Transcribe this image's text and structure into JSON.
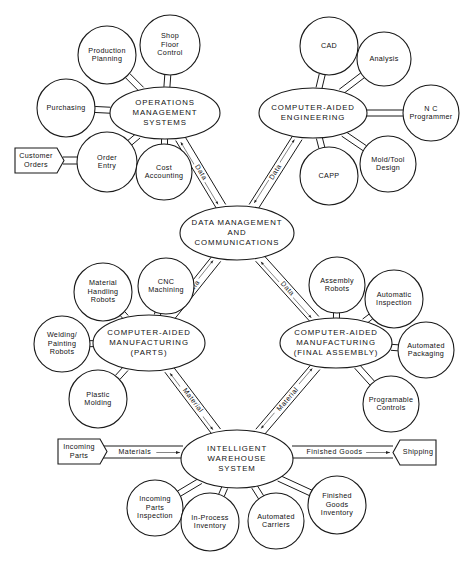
{
  "hubs": [
    {
      "id": "oms",
      "lines": [
        "OPERATIONS",
        "MANAGEMENT",
        "SYSTEMS"
      ],
      "cx": 165,
      "cy": 113,
      "rx": 55,
      "ry": 26
    },
    {
      "id": "cae",
      "lines": [
        "COMPUTER-AIDED",
        "ENGINEERING"
      ],
      "cx": 313,
      "cy": 113,
      "rx": 54,
      "ry": 25
    },
    {
      "id": "dmc",
      "lines": [
        "DATA MANAGEMENT",
        "AND",
        "COMMUNICATIONS"
      ],
      "cx": 237,
      "cy": 233,
      "rx": 57,
      "ry": 27
    },
    {
      "id": "camp",
      "lines": [
        "COMPUTER-AIDED",
        "MANUFACTURING",
        "(PARTS)"
      ],
      "cx": 149,
      "cy": 343,
      "rx": 56,
      "ry": 28
    },
    {
      "id": "camf",
      "lines": [
        "COMPUTER-AIDED",
        "MANUFACTURING",
        "(FINAL ASSEMBLY)"
      ],
      "cx": 336,
      "cy": 343,
      "rx": 56,
      "ry": 25
    },
    {
      "id": "iws",
      "lines": [
        "INTELLIGENT",
        "WAREHOUSE",
        "SYSTEM"
      ],
      "cx": 237,
      "cy": 459,
      "rx": 56,
      "ry": 29
    }
  ],
  "satellites": [
    {
      "id": "production-planning",
      "hub": "oms",
      "lines": [
        "Production",
        "Planning"
      ],
      "cx": 107,
      "cy": 55,
      "r": 29
    },
    {
      "id": "shop-floor-control",
      "hub": "oms",
      "lines": [
        "Shop",
        "Floor",
        "Control"
      ],
      "cx": 170,
      "cy": 45,
      "r": 30
    },
    {
      "id": "purchasing",
      "hub": "oms",
      "lines": [
        "Purchasing"
      ],
      "cx": 66,
      "cy": 108,
      "r": 29
    },
    {
      "id": "order-entry",
      "hub": "oms",
      "lines": [
        "Order",
        "Entry"
      ],
      "cx": 107,
      "cy": 162,
      "r": 30
    },
    {
      "id": "cost-accounting",
      "hub": "oms",
      "lines": [
        "Cost",
        "Accounting"
      ],
      "cx": 164,
      "cy": 172,
      "r": 28
    },
    {
      "id": "cad",
      "hub": "cae",
      "lines": [
        "CAD"
      ],
      "cx": 329,
      "cy": 46,
      "r": 29
    },
    {
      "id": "analysis",
      "hub": "cae",
      "lines": [
        "Analysis"
      ],
      "cx": 384,
      "cy": 59,
      "r": 27
    },
    {
      "id": "nc-programmer",
      "hub": "cae",
      "lines": [
        "N C",
        "Programmer"
      ],
      "cx": 431,
      "cy": 113,
      "r": 28
    },
    {
      "id": "capp",
      "hub": "cae",
      "lines": [
        "CAPP"
      ],
      "cx": 329,
      "cy": 176,
      "r": 29
    },
    {
      "id": "mold-tool-design",
      "hub": "cae",
      "lines": [
        "Mold/Tool",
        "Design"
      ],
      "cx": 388,
      "cy": 164,
      "r": 28
    },
    {
      "id": "material-handling-robots",
      "hub": "camp",
      "lines": [
        "Material",
        "Handling",
        "Robots"
      ],
      "cx": 103,
      "cy": 292,
      "r": 29
    },
    {
      "id": "cnc-machining",
      "hub": "camp",
      "lines": [
        "CNC",
        "Machining"
      ],
      "cx": 166,
      "cy": 286,
      "r": 28
    },
    {
      "id": "welding-painting-robots",
      "hub": "camp",
      "lines": [
        "Welding/",
        "Painting",
        "Robots"
      ],
      "cx": 62,
      "cy": 344,
      "r": 28
    },
    {
      "id": "plastic-molding",
      "hub": "camp",
      "lines": [
        "Plastic",
        "Molding"
      ],
      "cx": 98,
      "cy": 399,
      "r": 29
    },
    {
      "id": "assembly-robots",
      "hub": "camf",
      "lines": [
        "Assembly",
        "Robots"
      ],
      "cx": 337,
      "cy": 285,
      "r": 28
    },
    {
      "id": "automatic-inspection",
      "hub": "camf",
      "lines": [
        "Automatic",
        "Inspection"
      ],
      "cx": 394,
      "cy": 299,
      "r": 29
    },
    {
      "id": "automated-packaging",
      "hub": "camf",
      "lines": [
        "Automated",
        "Packaging"
      ],
      "cx": 426,
      "cy": 350,
      "r": 28
    },
    {
      "id": "programable-controls",
      "hub": "camf",
      "lines": [
        "Programable",
        "Controls"
      ],
      "cx": 391,
      "cy": 404,
      "r": 28
    },
    {
      "id": "incoming-parts-inspection",
      "hub": "iws",
      "lines": [
        "Incoming",
        "Parts",
        "Inspection"
      ],
      "cx": 155,
      "cy": 508,
      "r": 28
    },
    {
      "id": "in-process-inventory",
      "hub": "iws",
      "lines": [
        "In-Process",
        "Inventory"
      ],
      "cx": 210,
      "cy": 522,
      "r": 29
    },
    {
      "id": "automated-carriers",
      "hub": "iws",
      "lines": [
        "Automated",
        "Carriers"
      ],
      "cx": 276,
      "cy": 521,
      "r": 28
    },
    {
      "id": "finished-goods-inventory",
      "hub": "iws",
      "lines": [
        "Finished",
        "Goods",
        "Inventory"
      ],
      "cx": 337,
      "cy": 505,
      "r": 29
    }
  ],
  "terminals": [
    {
      "id": "customer-orders",
      "lines": [
        "Customer",
        "Orders"
      ],
      "x": 15,
      "y": 148,
      "w": 42,
      "h": 25,
      "point": "right",
      "to": "order-entry"
    },
    {
      "id": "incoming-parts",
      "lines": [
        "Incoming",
        "Parts"
      ],
      "x": 58,
      "y": 439,
      "w": 42,
      "h": 25,
      "point": "right",
      "to": "iws"
    },
    {
      "id": "shipping",
      "lines": [
        "Shipping"
      ],
      "x": 393,
      "y": 440,
      "w": 43,
      "h": 25,
      "point": "left",
      "from": "iws"
    }
  ],
  "links": [
    {
      "id": "oms-dmc",
      "from": "oms",
      "to": "dmc",
      "label": "Data"
    },
    {
      "id": "cae-dmc",
      "from": "cae",
      "to": "dmc",
      "label": "Data"
    },
    {
      "id": "dmc-camp",
      "from": "dmc",
      "to": "camp",
      "label": "Data"
    },
    {
      "id": "dmc-camf",
      "from": "dmc",
      "to": "camf",
      "label": "Data"
    },
    {
      "id": "camp-iws",
      "from": "camp",
      "to": "iws",
      "label": "Material"
    },
    {
      "id": "camf-iws",
      "from": "camf",
      "to": "iws",
      "label": "Material"
    }
  ],
  "flows": [
    {
      "id": "materials-flow",
      "label": "Materials",
      "x1": 100,
      "x2": 183,
      "y": 452
    },
    {
      "id": "finished-goods-flow",
      "label": "Finished Goods",
      "x1": 292,
      "x2": 393,
      "y": 452
    }
  ],
  "caption": {
    "text": "Figure: Computer-integrated manufacturing system"
  }
}
